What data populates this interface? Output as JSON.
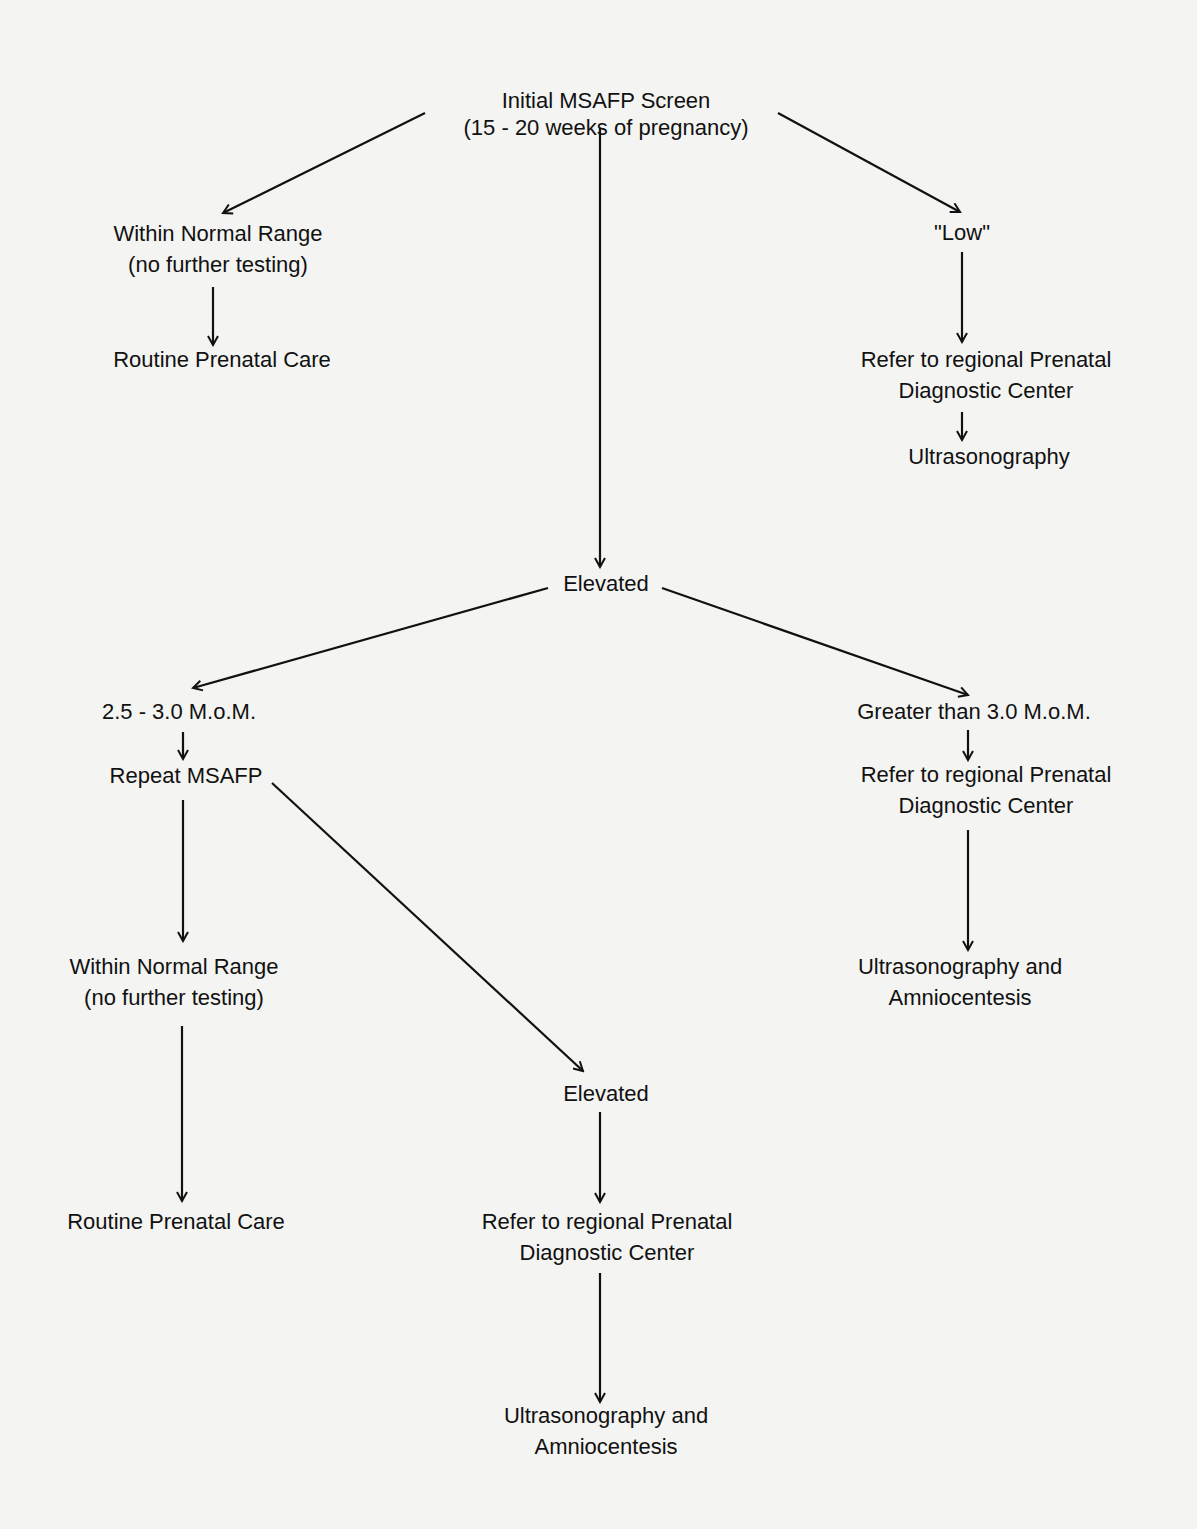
{
  "diagram": {
    "nodes": {
      "initial": {
        "line1": "Initial MSAFP Screen",
        "line2": "(15 - 20 weeks of pregnancy)"
      },
      "normal1": {
        "line1": "Within Normal Range",
        "line2": "(no further testing)"
      },
      "routine1": {
        "line1": "Routine Prenatal Care"
      },
      "low": {
        "line1": "\"Low\""
      },
      "refer_low": {
        "line1": "Refer to regional Prenatal",
        "line2": "Diagnostic Center"
      },
      "ultra_low": {
        "line1": "Ultrasonography"
      },
      "elevated1": {
        "line1": "Elevated"
      },
      "mom_range": {
        "line1": "2.5 - 3.0 M.o.M."
      },
      "repeat": {
        "line1": "Repeat MSAFP"
      },
      "greater": {
        "line1": "Greater than 3.0 M.o.M."
      },
      "refer_greater": {
        "line1": "Refer to regional Prenatal",
        "line2": "Diagnostic Center"
      },
      "ultra_amnio_right": {
        "line1": "Ultrasonography and",
        "line2": "Amniocentesis"
      },
      "normal2": {
        "line1": "Within Normal Range",
        "line2": "(no further testing)"
      },
      "routine2": {
        "line1": "Routine Prenatal Care"
      },
      "elevated2": {
        "line1": "Elevated"
      },
      "refer_bottom": {
        "line1": "Refer to regional Prenatal",
        "line2": "Diagnostic Center"
      },
      "ultra_amnio_bottom": {
        "line1": "Ultrasonography and",
        "line2": "Amniocentesis"
      }
    },
    "edges": [
      {
        "from": "initial",
        "to": "normal1"
      },
      {
        "from": "initial",
        "to": "low"
      },
      {
        "from": "initial",
        "to": "elevated1"
      },
      {
        "from": "normal1",
        "to": "routine1"
      },
      {
        "from": "low",
        "to": "refer_low"
      },
      {
        "from": "refer_low",
        "to": "ultra_low"
      },
      {
        "from": "elevated1",
        "to": "mom_range"
      },
      {
        "from": "elevated1",
        "to": "greater"
      },
      {
        "from": "mom_range",
        "to": "repeat"
      },
      {
        "from": "repeat",
        "to": "normal2"
      },
      {
        "from": "repeat",
        "to": "elevated2"
      },
      {
        "from": "normal2",
        "to": "routine2"
      },
      {
        "from": "greater",
        "to": "refer_greater"
      },
      {
        "from": "refer_greater",
        "to": "ultra_amnio_right"
      },
      {
        "from": "elevated2",
        "to": "refer_bottom"
      },
      {
        "from": "refer_bottom",
        "to": "ultra_amnio_bottom"
      }
    ],
    "colors": {
      "background": "#f4f4f2",
      "ink": "#111111"
    }
  }
}
